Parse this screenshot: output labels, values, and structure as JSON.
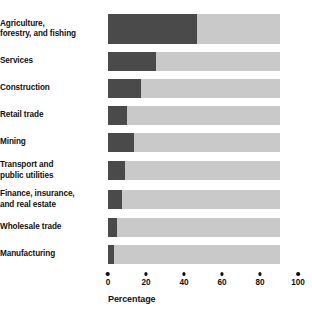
{
  "chart_data": {
    "type": "bar",
    "orientation": "horizontal",
    "title": "",
    "xlabel": "Percentage",
    "ylabel": "",
    "xlim": [
      0,
      100
    ],
    "xticks": [
      "0",
      "20",
      "40",
      "60",
      "80",
      "100"
    ],
    "grid": false,
    "legend": false,
    "colors": {
      "value_segment": "#4a4a4a",
      "remainder_segment": "#c9c9c9",
      "text": "#111111",
      "background": "#ffffff"
    },
    "categories": [
      "Agriculture, forestry, and fishing",
      "Services",
      "Construction",
      "Retail trade",
      "Mining",
      "Transport and public utilities",
      "Finance, insurance, and real estate",
      "Wholesale trade",
      "Manufacturing"
    ],
    "values": [
      52,
      28,
      19,
      11,
      15,
      10,
      8,
      5.5,
      3.5
    ],
    "bars": [
      {
        "label_line1": "Agriculture,",
        "label_line2": "forestry, and fishing",
        "value": 52,
        "tall": true
      },
      {
        "label_line1": "Services",
        "label_line2": "",
        "value": 28,
        "tall": false
      },
      {
        "label_line1": "Construction",
        "label_line2": "",
        "value": 19,
        "tall": false
      },
      {
        "label_line1": "Retail trade",
        "label_line2": "",
        "value": 11,
        "tall": false
      },
      {
        "label_line1": "Mining",
        "label_line2": "",
        "value": 15,
        "tall": false
      },
      {
        "label_line1": "Transport and",
        "label_line2": "public utilities",
        "value": 10,
        "tall": false
      },
      {
        "label_line1": "Finance, insurance,",
        "label_line2": "and real estate",
        "value": 8,
        "tall": false
      },
      {
        "label_line1": "Wholesale trade",
        "label_line2": "",
        "value": 5.5,
        "tall": false
      },
      {
        "label_line1": "Manufacturing",
        "label_line2": "",
        "value": 3.5,
        "tall": false
      }
    ]
  }
}
